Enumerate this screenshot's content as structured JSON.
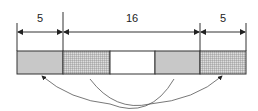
{
  "diagram": {
    "labels": {
      "left": "5",
      "middle": "16",
      "right": "5"
    },
    "segments": [
      {
        "name": "left-end",
        "fill": "gray"
      },
      {
        "name": "middle-left",
        "fill": "grid"
      },
      {
        "name": "middle-center",
        "fill": "white"
      },
      {
        "name": "middle-right",
        "fill": "gray"
      },
      {
        "name": "right-end",
        "fill": "grid"
      }
    ],
    "arrows": [
      {
        "from": "middle-right",
        "to": "left-end"
      },
      {
        "from": "middle-left",
        "to": "right-end"
      }
    ],
    "colors": {
      "gray": "#c8c8c8",
      "line": "#333333"
    }
  }
}
